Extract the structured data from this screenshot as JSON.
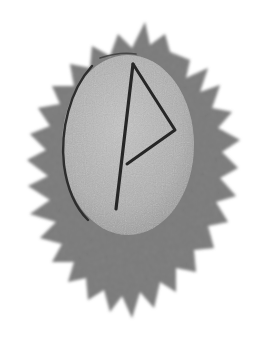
{
  "image": {
    "subject": "Rune stone with Wunjo rune on jagged starburst",
    "rune_name": "Wunjo",
    "rune_glyph": "ᚹ",
    "colors": {
      "background": "#ffffff",
      "starburst": "#6b6b6b",
      "starburst_edge": "#8a8a8a",
      "stone": "#b4b4b4",
      "stone_highlight": "#c8c8c8",
      "stone_shadow": "#9a9a9a",
      "rune_stroke": "#2a2a2a"
    }
  }
}
